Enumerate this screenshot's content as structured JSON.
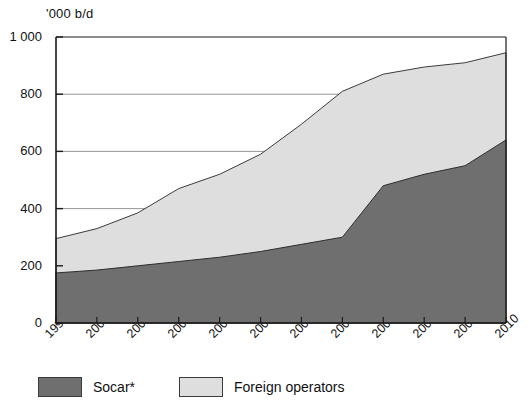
{
  "chart_data": {
    "type": "area",
    "stacked": true,
    "title": "",
    "subtitle": "",
    "unit_label": "'000 b/d",
    "xlabel": "",
    "ylabel": "",
    "categories": [
      "1999",
      "2000",
      "2001",
      "2002",
      "2003",
      "2004",
      "2005",
      "2006",
      "2007",
      "2008",
      "2009",
      "2010"
    ],
    "ylim": [
      0,
      1000
    ],
    "ytick_values": [
      0,
      200,
      400,
      600,
      800,
      1000
    ],
    "ytick_labels": [
      "0",
      "200",
      "400",
      "600",
      "800",
      "1 000"
    ],
    "grid": "horizontal",
    "legend_position": "bottom-left",
    "series": [
      {
        "name": "Socar*",
        "color": "#6f6f6f",
        "values": [
          175,
          185,
          200,
          215,
          230,
          250,
          275,
          300,
          480,
          520,
          550,
          640
        ]
      },
      {
        "name": "Foreign operators",
        "color": "#dedede",
        "values": [
          120,
          145,
          185,
          255,
          290,
          340,
          420,
          510,
          390,
          375,
          360,
          305
        ]
      }
    ],
    "totals": [
      295,
      330,
      385,
      470,
      520,
      590,
      695,
      810,
      870,
      895,
      910,
      945
    ]
  },
  "legend": {
    "items": [
      {
        "label": "Socar*",
        "swatch_color": "#6f6f6f"
      },
      {
        "label": "Foreign operators",
        "swatch_color": "#dedede"
      }
    ]
  },
  "axes": {
    "unit_label": "'000 b/d"
  }
}
